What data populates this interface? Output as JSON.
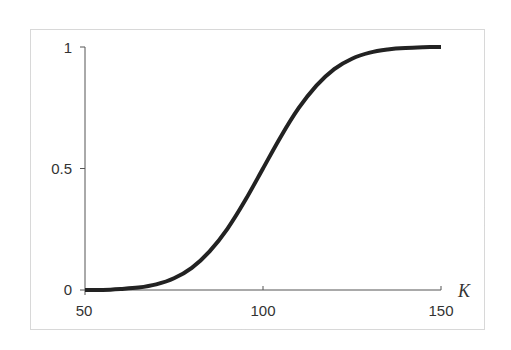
{
  "chart_data": {
    "type": "line",
    "title": "",
    "xlabel": "K",
    "ylabel": "",
    "xlim": [
      50,
      150
    ],
    "ylim": [
      0,
      1
    ],
    "grid": false,
    "legend": null,
    "x_ticks": [
      50,
      100,
      150
    ],
    "x_tick_labels": [
      "50",
      "100",
      "150"
    ],
    "y_ticks": [
      0,
      0.5,
      1
    ],
    "y_tick_labels": [
      "0",
      "0.5",
      "1"
    ],
    "series": [
      {
        "name": "cumulative probability",
        "description": "S-shaped cumulative curve (approx. normal CDF, mean 100, sd 15)",
        "color": "#222222",
        "x": [
          50,
          55,
          60,
          65,
          70,
          75,
          80,
          85,
          90,
          95,
          100,
          105,
          110,
          115,
          120,
          125,
          130,
          135,
          140,
          145,
          150
        ],
        "values": [
          0.0,
          0.0,
          0.004,
          0.01,
          0.023,
          0.048,
          0.091,
          0.159,
          0.252,
          0.369,
          0.5,
          0.631,
          0.748,
          0.841,
          0.909,
          0.952,
          0.977,
          0.99,
          0.996,
          0.999,
          1.0
        ]
      }
    ]
  },
  "colors": {
    "curve": "#222222",
    "axis": "#555555",
    "frame": "#aaaaaa",
    "text": "#333333"
  }
}
